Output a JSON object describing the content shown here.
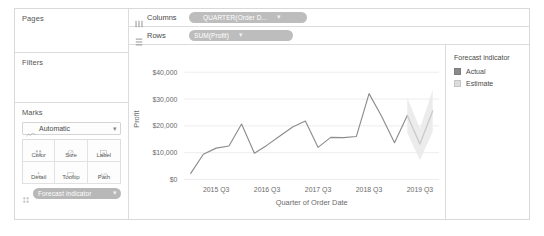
{
  "shelves": {
    "pages": {
      "title": "Pages",
      "icon": "pages-icon"
    },
    "filters": {
      "title": "Filters",
      "icon": "filters-icon"
    },
    "columns": {
      "label": "Columns",
      "icon": "columns-icon",
      "pill": {
        "text": "QUARTER(Order D...",
        "icon": "date-icon",
        "caret": "▾"
      }
    },
    "rows": {
      "label": "Rows",
      "icon": "rows-icon",
      "pill": {
        "text": "SUM(Profit)",
        "icon": "",
        "caret": "▾"
      }
    }
  },
  "marks": {
    "title": "Marks",
    "type": {
      "label": "Automatic",
      "icon": "line-mark-icon",
      "caret": "▾"
    },
    "buttons": [
      {
        "label": "Color",
        "icon": "color-icon"
      },
      {
        "label": "Size",
        "icon": "size-icon"
      },
      {
        "label": "Label",
        "icon": "label-icon"
      },
      {
        "label": "Detail",
        "icon": "detail-icon"
      },
      {
        "label": "Tooltip",
        "icon": "tooltip-icon"
      },
      {
        "label": "Path",
        "icon": "path-icon"
      }
    ],
    "pill": {
      "text": "Forecast indicator",
      "icon": "color-icon",
      "caret": "▾"
    }
  },
  "legend": {
    "title": "Forecast indicator",
    "items": [
      {
        "label": "Actual",
        "color": "#8a8a8a"
      },
      {
        "label": "Estimate",
        "color": "#dcdcdc"
      }
    ]
  },
  "colors": {
    "actual_line": "#8c8c8c",
    "estimate_line": "#c9c9c9",
    "estimate_band": "#e9e9e9",
    "gridline": "#ededed",
    "axis_text": "#6b6b6b",
    "pill_fill": "#bdbdbd",
    "panel_border": "#d9d9d9"
  },
  "chart_data": {
    "type": "line",
    "title": "",
    "xlabel": "Quarter of Order Date",
    "ylabel": "Profit",
    "ylim": [
      0,
      45000
    ],
    "yticks": [
      0,
      10000,
      20000,
      30000,
      40000
    ],
    "ytick_labels": [
      "$0",
      "$10,000",
      "$20,000",
      "$30,000",
      "$40,000"
    ],
    "xtick_labels": [
      "2015 Q3",
      "2016 Q3",
      "2017 Q3",
      "2018 Q3",
      "2019 Q3"
    ],
    "grid": "horizontal",
    "legend_position": "right",
    "x": [
      "2015 Q1",
      "2015 Q2",
      "2015 Q3",
      "2015 Q4",
      "2016 Q1",
      "2016 Q2",
      "2016 Q3",
      "2016 Q4",
      "2017 Q1",
      "2017 Q2",
      "2017 Q3",
      "2017 Q4",
      "2018 Q1",
      "2018 Q2",
      "2018 Q3",
      "2018 Q4",
      "2019 Q1",
      "2019 Q2",
      "2019 Q3",
      "2019 Q4"
    ],
    "series": [
      {
        "name": "Actual",
        "color": "#8c8c8c",
        "values": [
          2300,
          9400,
          11700,
          12500,
          20700,
          9800,
          12800,
          16200,
          19600,
          21800,
          12000,
          15700,
          15600,
          16000,
          32000,
          23500,
          13700,
          23900,
          null,
          null
        ]
      },
      {
        "name": "Estimate",
        "color": "#c9c9c9",
        "values": [
          null,
          null,
          null,
          null,
          null,
          null,
          null,
          null,
          null,
          null,
          null,
          null,
          null,
          null,
          null,
          null,
          null,
          23900,
          13200,
          25600
        ],
        "band_upper": [
          null,
          null,
          null,
          null,
          null,
          null,
          null,
          null,
          null,
          null,
          null,
          null,
          null,
          null,
          null,
          null,
          null,
          30500,
          19000,
          33500
        ],
        "band_lower": [
          null,
          null,
          null,
          null,
          null,
          null,
          null,
          null,
          null,
          null,
          null,
          null,
          null,
          null,
          null,
          null,
          null,
          17300,
          7200,
          17800
        ]
      }
    ]
  }
}
